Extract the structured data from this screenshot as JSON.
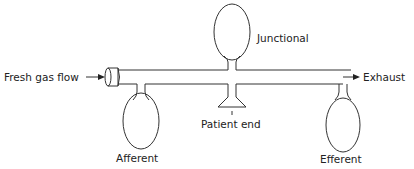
{
  "diagram": {
    "labels": {
      "fresh_gas_flow": "Fresh gas flow",
      "junctional": "Junctional",
      "exhaust": "Exhaust",
      "patient_end": "Patient end",
      "afferent": "Afferent",
      "efferent": "Efferent"
    },
    "colors": {
      "stroke": "#333333",
      "text": "#222222",
      "background": "#ffffff"
    }
  }
}
